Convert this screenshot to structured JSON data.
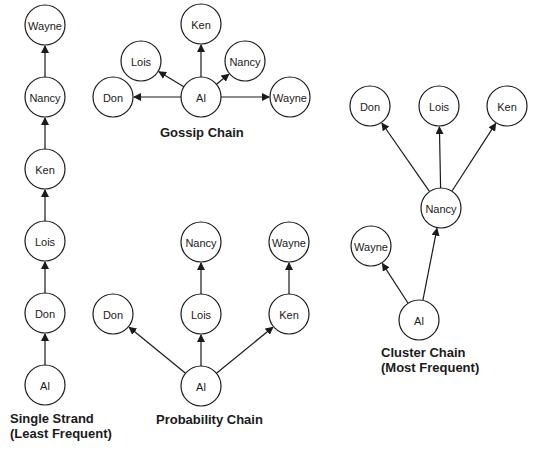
{
  "diagrams": [
    {
      "id": "single-strand",
      "title": "Single Strand",
      "subtitle": "(Least Frequent)",
      "nodes": [
        {
          "name": "Wayne",
          "x": 45,
          "y": 25
        },
        {
          "name": "Nancy",
          "x": 45,
          "y": 97
        },
        {
          "name": "Ken",
          "x": 45,
          "y": 169
        },
        {
          "name": "Lois",
          "x": 45,
          "y": 241
        },
        {
          "name": "Don",
          "x": 45,
          "y": 313
        },
        {
          "name": "Al",
          "x": 45,
          "y": 385
        }
      ],
      "edges": [
        [
          "Al",
          "Don"
        ],
        [
          "Don",
          "Lois"
        ],
        [
          "Lois",
          "Ken"
        ],
        [
          "Ken",
          "Nancy"
        ],
        [
          "Nancy",
          "Wayne"
        ]
      ]
    },
    {
      "id": "gossip-chain",
      "title": "Gossip Chain",
      "subtitle": "",
      "nodes": [
        {
          "name": "Ken",
          "x": 201,
          "y": 24
        },
        {
          "name": "Lois",
          "x": 141,
          "y": 61
        },
        {
          "name": "Nancy",
          "x": 245,
          "y": 61
        },
        {
          "name": "Don",
          "x": 113,
          "y": 97
        },
        {
          "name": "Al",
          "x": 201,
          "y": 97
        },
        {
          "name": "Wayne",
          "x": 290,
          "y": 97
        }
      ],
      "edges": [
        [
          "Al",
          "Ken"
        ],
        [
          "Al",
          "Lois"
        ],
        [
          "Al",
          "Nancy"
        ],
        [
          "Al",
          "Don"
        ],
        [
          "Al",
          "Wayne"
        ]
      ]
    },
    {
      "id": "probability-chain",
      "title": "Probability Chain",
      "subtitle": "",
      "nodes": [
        {
          "name": "Nancy",
          "x": 201,
          "y": 242
        },
        {
          "name": "Wayne",
          "x": 289,
          "y": 242
        },
        {
          "name": "Don",
          "x": 113,
          "y": 314
        },
        {
          "name": "Lois",
          "x": 201,
          "y": 314
        },
        {
          "name": "Ken",
          "x": 289,
          "y": 314
        },
        {
          "name": "Al",
          "x": 201,
          "y": 386
        }
      ],
      "edges": [
        [
          "Al",
          "Don"
        ],
        [
          "Al",
          "Lois"
        ],
        [
          "Al",
          "Ken"
        ],
        [
          "Lois",
          "Nancy"
        ],
        [
          "Ken",
          "Wayne"
        ]
      ]
    },
    {
      "id": "cluster-chain",
      "title": "Cluster Chain",
      "subtitle": "(Most Frequent)",
      "nodes": [
        {
          "name": "Don",
          "x": 370,
          "y": 106
        },
        {
          "name": "Lois",
          "x": 439,
          "y": 106
        },
        {
          "name": "Ken",
          "x": 507,
          "y": 106
        },
        {
          "name": "Nancy",
          "x": 441,
          "y": 208
        },
        {
          "name": "Wayne",
          "x": 371,
          "y": 246
        },
        {
          "name": "Al",
          "x": 419,
          "y": 320
        }
      ],
      "edges": [
        [
          "Al",
          "Wayne"
        ],
        [
          "Al",
          "Nancy"
        ],
        [
          "Nancy",
          "Don"
        ],
        [
          "Nancy",
          "Lois"
        ],
        [
          "Nancy",
          "Ken"
        ]
      ]
    }
  ],
  "labels": {
    "single_strand_title": "Single Strand",
    "single_strand_sub": "(Least Frequent)",
    "gossip_title": "Gossip Chain",
    "probability_title": "Probability Chain",
    "cluster_title": "Cluster Chain",
    "cluster_sub": "(Most Frequent)"
  },
  "style": {
    "node_radius": 20,
    "stroke_color": "#1a1a1a",
    "background": "#ffffff"
  }
}
